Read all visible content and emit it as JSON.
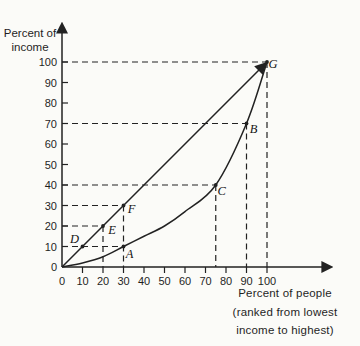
{
  "page": {
    "background": "#fbfbf8",
    "ink": "#222222"
  },
  "chart_data": {
    "type": "line",
    "title": "",
    "ylabel": "Percent of income",
    "ylabel_lines": [
      "Percent of",
      "income"
    ],
    "xlabel": "Percent of people (ranked from lowest income to highest)",
    "xlabel_lines": [
      "Percent of people",
      "(ranked from lowest",
      "income to highest)"
    ],
    "xlim": [
      0,
      100
    ],
    "ylim": [
      0,
      100
    ],
    "x_ticks": [
      0,
      10,
      20,
      30,
      40,
      50,
      60,
      70,
      80,
      90,
      100
    ],
    "y_ticks": [
      0,
      10,
      20,
      30,
      40,
      50,
      60,
      70,
      80,
      90,
      100
    ],
    "grid": false,
    "legend": "none",
    "series": [
      {
        "name": "line of equality",
        "shape": "straight",
        "arrow_at_end": true,
        "points": [
          [
            0,
            0
          ],
          [
            100,
            100
          ]
        ]
      },
      {
        "name": "Lorenz curve",
        "shape": "smooth",
        "arrow_at_end": false,
        "points": [
          [
            0,
            0
          ],
          [
            10,
            2
          ],
          [
            20,
            5
          ],
          [
            30,
            10
          ],
          [
            40,
            15
          ],
          [
            50,
            20
          ],
          [
            60,
            27
          ],
          [
            75,
            40
          ],
          [
            90,
            70
          ],
          [
            100,
            100
          ]
        ]
      }
    ],
    "labeled_points": [
      {
        "label": "D",
        "x": 10,
        "y": 10,
        "on": "line of equality",
        "dx": -8,
        "dy": -8
      },
      {
        "label": "E",
        "x": 20,
        "y": 20,
        "on": "line of equality",
        "dx": 9,
        "dy": 4
      },
      {
        "label": "F",
        "x": 30,
        "y": 30,
        "on": "line of equality",
        "dx": 8,
        "dy": 3
      },
      {
        "label": "A",
        "x": 30,
        "y": 10,
        "on": "Lorenz curve",
        "dx": 6,
        "dy": 7
      },
      {
        "label": "C",
        "x": 75,
        "y": 40,
        "on": "Lorenz curve",
        "dx": 6,
        "dy": 6
      },
      {
        "label": "B",
        "x": 90,
        "y": 70,
        "on": "Lorenz curve",
        "dx": 7,
        "dy": 5
      },
      {
        "label": "G",
        "x": 100,
        "y": 100,
        "on": "both",
        "dx": 6,
        "dy": 2
      }
    ],
    "dashed_guides": {
      "horizontal": [
        {
          "y": 10,
          "to_x": 30
        },
        {
          "y": 20,
          "to_x": 20
        },
        {
          "y": 30,
          "to_x": 30
        },
        {
          "y": 40,
          "to_x": 75
        },
        {
          "y": 70,
          "to_x": 90
        },
        {
          "y": 100,
          "to_x": 100
        }
      ],
      "vertical": [
        {
          "x": 20,
          "from_y": 20
        },
        {
          "x": 30,
          "from_y": 30
        },
        {
          "x": 75,
          "from_y": 40
        },
        {
          "x": 90,
          "from_y": 70
        },
        {
          "x": 100,
          "from_y": 100
        }
      ]
    }
  }
}
